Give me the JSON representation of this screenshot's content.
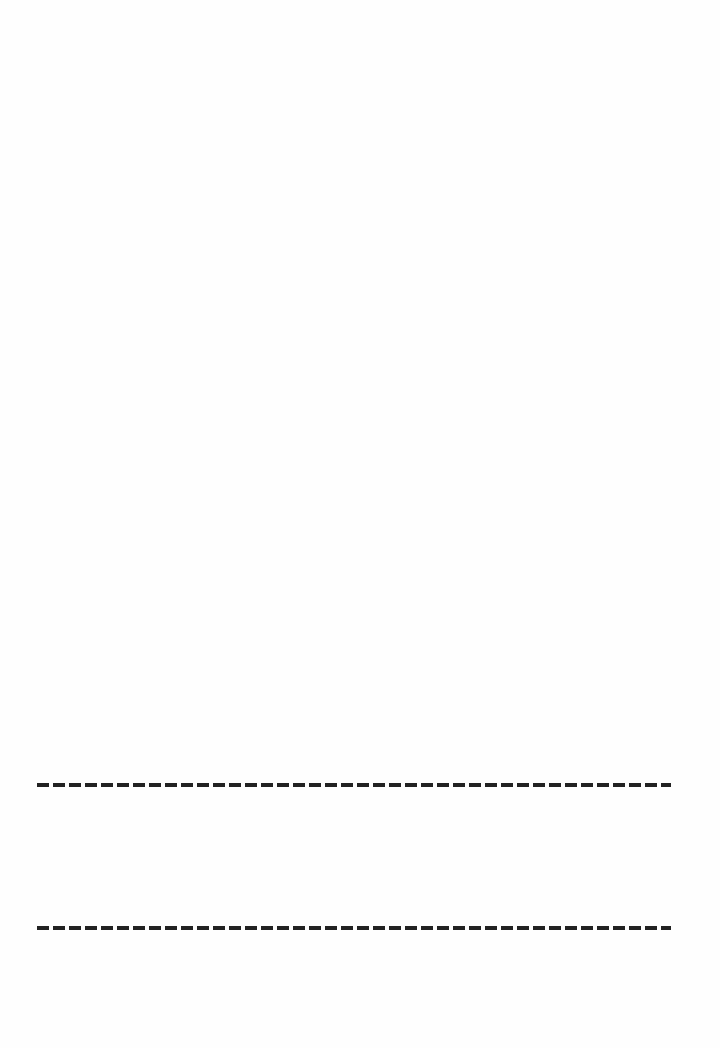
{
  "page": {
    "background_color": "#ffffff",
    "lines": [
      {
        "style": "dashed",
        "color": "#222222",
        "y": 785
      },
      {
        "style": "dashed",
        "color": "#222222",
        "y": 928
      }
    ]
  }
}
